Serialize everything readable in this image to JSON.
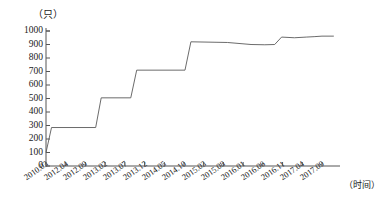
{
  "chart_data": {
    "type": "line",
    "title": "",
    "subtitle": "",
    "xlabel": "（时间）",
    "ylabel": "（只）",
    "ylim": [
      0,
      1000
    ],
    "ytick_values": [
      0,
      100,
      200,
      300,
      400,
      500,
      600,
      700,
      800,
      900,
      1000
    ],
    "ytick_labels": [
      "0",
      "100",
      "200",
      "300",
      "400",
      "500",
      "600",
      "700",
      "800",
      "900",
      "1000"
    ],
    "grid": false,
    "legend": null,
    "categories": [
      "2010.03",
      "2012.04",
      "2012.09",
      "2013.02",
      "2013.07",
      "2013.12",
      "2014.05",
      "2014.10",
      "2015.03",
      "2015.08",
      "2016.01",
      "2016.06",
      "2016.11",
      "2017.04",
      "2017.09"
    ],
    "series": [
      {
        "name": "基金数量",
        "values": [
          100,
          285,
          285,
          505,
          505,
          710,
          710,
          920,
          915,
          910,
          900,
          900,
          955,
          950,
          962
        ]
      }
    ],
    "points": [
      {
        "x": 0.0,
        "y": 100
      },
      {
        "x": 0.28,
        "y": 285
      },
      {
        "x": 2.52,
        "y": 285
      },
      {
        "x": 2.8,
        "y": 505
      },
      {
        "x": 4.3,
        "y": 505
      },
      {
        "x": 4.6,
        "y": 710
      },
      {
        "x": 7.05,
        "y": 710
      },
      {
        "x": 7.35,
        "y": 920
      },
      {
        "x": 9.2,
        "y": 915
      },
      {
        "x": 10.4,
        "y": 900
      },
      {
        "x": 11.1,
        "y": 898
      },
      {
        "x": 11.6,
        "y": 900
      },
      {
        "x": 11.95,
        "y": 955
      },
      {
        "x": 12.6,
        "y": 950
      },
      {
        "x": 13.2,
        "y": 955
      },
      {
        "x": 13.6,
        "y": 958
      },
      {
        "x": 14.0,
        "y": 962
      },
      {
        "x": 14.6,
        "y": 962
      }
    ],
    "axis_color": "#555555",
    "line_color": "#5a5a5a"
  }
}
